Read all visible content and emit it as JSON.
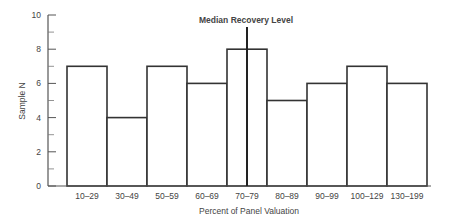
{
  "chart_data": {
    "type": "bar",
    "title": "",
    "xlabel": "Percent of Panel Valuation",
    "ylabel": "Sample N",
    "categories": [
      "10–29",
      "30–49",
      "50–59",
      "60–69",
      "70–79",
      "80–89",
      "90–99",
      "100–129",
      "130–199"
    ],
    "values": [
      7,
      4,
      7,
      6,
      8,
      5,
      6,
      7,
      6
    ],
    "ylim": [
      0,
      10
    ],
    "yticks": [
      0,
      2,
      4,
      6,
      8,
      10
    ],
    "yminor_ticks": [
      1,
      3,
      5,
      7,
      9
    ],
    "grid": false,
    "legend": null,
    "annotations": [
      {
        "text": "Median Recovery Level",
        "type": "vertical-line",
        "position": "within 70–79 bin, about midpoint"
      }
    ],
    "bar_style": {
      "fill": "#ffffff",
      "stroke": "#333333"
    }
  }
}
